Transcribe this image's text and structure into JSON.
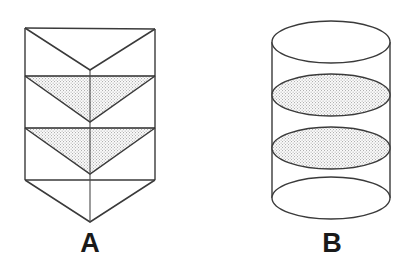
{
  "page": {
    "background_color": "#ffffff",
    "width": 406,
    "height": 269
  },
  "style": {
    "stroke_color": "#3a3a3a",
    "stroke_color_dark": "#2b2b2b",
    "stipple_dot_color": "#8f8f8f",
    "stipple_background": "#fbfbfb",
    "label_color": "#1a1a1a",
    "stroke_width": 1.3
  },
  "figures": [
    {
      "id": "figure-a",
      "label": "A",
      "shape": "chevron-folded-prism",
      "description": "Rectangular prism whose front face is folded into downward-pointing V shapes, with two stippled triangular cross-section bands",
      "geometry": {
        "left_x": 25,
        "right_x": 155,
        "top_y": 28,
        "bottom_rim_y": 180,
        "apex_bottom_y": 222,
        "center_x": 90,
        "band_lines_y": [
          76,
          128
        ],
        "v_apexes_y": [
          70,
          122,
          174
        ],
        "shaded_band_count": 2
      },
      "shaded_regions": [
        {
          "name": "upper-triangle",
          "top_y": 76,
          "apex_y": 122,
          "filled": true
        },
        {
          "name": "lower-triangle",
          "top_y": 128,
          "apex_y": 174,
          "filled": true
        }
      ]
    },
    {
      "id": "figure-b",
      "label": "B",
      "shape": "cylinder",
      "description": "Upright cylinder with visible top ellipse, bottom ellipse and two stippled internal elliptical cross-sections",
      "geometry": {
        "left_x": 272,
        "right_x": 390,
        "center_x": 331,
        "radius_x": 59,
        "radius_y": 21,
        "top_ellipse_cy": 42,
        "bottom_ellipse_cy": 198,
        "side_top_y": 42,
        "side_bottom_y": 198
      },
      "shaded_regions": [
        {
          "name": "upper-cross-section",
          "cy": 95,
          "filled": true
        },
        {
          "name": "lower-cross-section",
          "cy": 148,
          "filled": true
        }
      ]
    }
  ],
  "labels": {
    "figure_a_label": "A",
    "figure_b_label": "B"
  }
}
